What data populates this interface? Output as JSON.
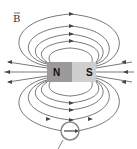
{
  "diagram": {
    "field_label": "B",
    "magnet": {
      "north_label": "N",
      "south_label": "S",
      "north_color": "#9a9a9a",
      "south_color": "#c8c8c8"
    },
    "field_line_color": "#555555",
    "compass_label": "compass"
  }
}
